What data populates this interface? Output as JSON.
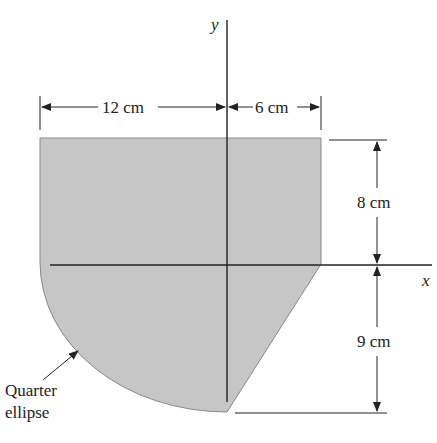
{
  "figure": {
    "axes": {
      "x_label": "x",
      "y_label": "y"
    },
    "dimensions": {
      "left_width": "12 cm",
      "right_width": "6 cm",
      "upper_height": "8 cm",
      "lower_height": "9 cm"
    },
    "annotation": {
      "line1": "Quarter",
      "line2": "ellipse"
    },
    "colors": {
      "fill": "#c8c8c8",
      "line": "#222222"
    }
  }
}
